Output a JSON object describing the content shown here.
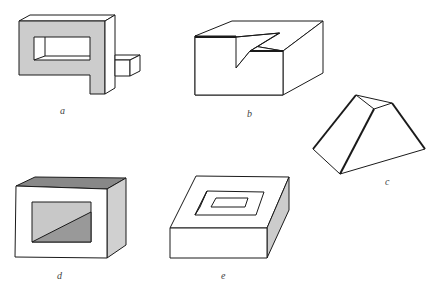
{
  "figure": {
    "colors": {
      "line": "#1a1a1a",
      "shade_light": "#cccccc",
      "shade_mid": "#b0b0b0",
      "shade_dark": "#888888",
      "background": "#ffffff"
    },
    "panels": [
      {
        "id": "a",
        "label": "a",
        "object": "impossible-frame-with-bar"
      },
      {
        "id": "b",
        "label": "b",
        "object": "block-with-triangular-notch"
      },
      {
        "id": "c",
        "label": "c",
        "object": "truncated-prism"
      },
      {
        "id": "d",
        "label": "d",
        "object": "box-with-window"
      },
      {
        "id": "e",
        "label": "e",
        "object": "slab-with-square-hole"
      }
    ]
  }
}
